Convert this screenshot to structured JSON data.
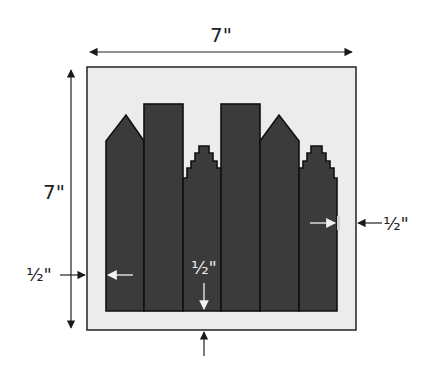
{
  "diagram": {
    "colors": {
      "background": "#ffffff",
      "block_background": "#ececec",
      "building_fill": "#3b3b3b",
      "outline": "#111111",
      "dimension_line": "#222222",
      "inner_arrow": "#e6e6e6"
    },
    "dimensions": {
      "width_label": "7\"",
      "height_label": "7\"",
      "right_margin_label": "½\"",
      "left_margin_label": "½\"",
      "bottom_margin_label": "½\""
    },
    "buildings": [
      {
        "name": "peaked-building-1",
        "shape": "peaked"
      },
      {
        "name": "tall-flat-building-2",
        "shape": "flat"
      },
      {
        "name": "stepped-building-3",
        "shape": "stepped"
      },
      {
        "name": "tall-flat-building-4",
        "shape": "flat"
      },
      {
        "name": "peaked-building-5",
        "shape": "peaked"
      },
      {
        "name": "stepped-building-6",
        "shape": "stepped"
      }
    ]
  }
}
